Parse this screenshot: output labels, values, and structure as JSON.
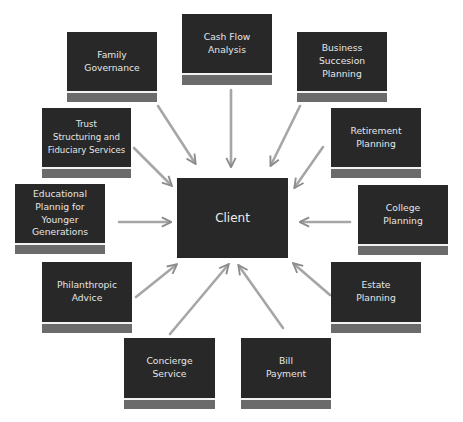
{
  "diagram": {
    "center": {
      "id": "client",
      "label": "Client"
    },
    "nodes": [
      {
        "id": "cash-flow-analysis",
        "label": "Cash Flow\nAnalysis"
      },
      {
        "id": "family-governance",
        "label": "Family\nGovernance"
      },
      {
        "id": "business-succesion-planning",
        "label": "Business\nSuccesion\nPlanning"
      },
      {
        "id": "trust-structuring",
        "label": "Trust\nStructuring and\nFiduciary Services"
      },
      {
        "id": "retirement-planning",
        "label": "Retirement\nPlanning"
      },
      {
        "id": "educational-planning",
        "label": "Educational\nPlannig for\nYounger\nGenerations"
      },
      {
        "id": "college-planning",
        "label": "College\nPlanning"
      },
      {
        "id": "philanthropic-advice",
        "label": "Philanthropic\nAdvice"
      },
      {
        "id": "estate-planning",
        "label": "Estate\nPlanning"
      },
      {
        "id": "concierge-service",
        "label": "Concierge\nService"
      },
      {
        "id": "bill-payment",
        "label": "Bill\nPayment"
      }
    ],
    "edges": [
      {
        "from": "cash-flow-analysis",
        "to": "client"
      },
      {
        "from": "family-governance",
        "to": "client"
      },
      {
        "from": "business-succesion-planning",
        "to": "client"
      },
      {
        "from": "trust-structuring",
        "to": "client"
      },
      {
        "from": "retirement-planning",
        "to": "client"
      },
      {
        "from": "educational-planning",
        "to": "client"
      },
      {
        "from": "college-planning",
        "to": "client"
      },
      {
        "from": "philanthropic-advice",
        "to": "client"
      },
      {
        "from": "estate-planning",
        "to": "client"
      },
      {
        "from": "concierge-service",
        "to": "client"
      },
      {
        "from": "bill-payment",
        "to": "client"
      }
    ],
    "colors": {
      "box_fill": "#282828",
      "box_text": "#e6e6e6",
      "box_footer": "#6b6b6b",
      "arrow": "#9a9a9a",
      "background": "#ffffff"
    }
  }
}
